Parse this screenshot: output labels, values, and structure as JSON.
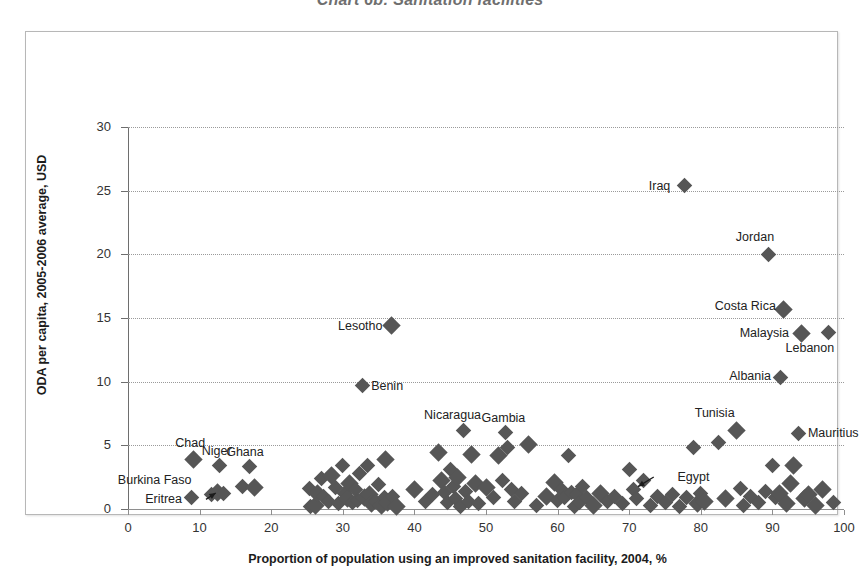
{
  "chart_data": {
    "type": "scatter",
    "title": "Chart 6b: Sanitation facilities",
    "xlabel": "Proportion of population using an improved sanitation facility, 2004,  %",
    "ylabel": "ODA per capita, 2005-2006 average, USD",
    "xlim": [
      0,
      100
    ],
    "ylim": [
      0,
      30
    ],
    "xticks": [
      0,
      10,
      20,
      30,
      40,
      50,
      60,
      70,
      80,
      90,
      100
    ],
    "yticks": [
      0,
      5,
      10,
      15,
      20,
      25,
      30
    ],
    "grid": "horizontal-dotted",
    "legend": "none",
    "marker": "diamond",
    "marker_color": "#565656",
    "labeled_points": [
      {
        "name": "Iraq",
        "x": 77.7,
        "y": 25.4,
        "label_side": "left"
      },
      {
        "name": "Jordan",
        "x": 89.4,
        "y": 20.0,
        "label_side": "above-left"
      },
      {
        "name": "Costa Rica",
        "x": 91.6,
        "y": 15.7,
        "label_side": "left"
      },
      {
        "name": "Malaysia",
        "x": 94.0,
        "y": 13.8,
        "label_side": "left"
      },
      {
        "name": "Lebanon",
        "x": 97.8,
        "y": 13.9,
        "label_side": "below-left"
      },
      {
        "name": "Albania",
        "x": 91.2,
        "y": 10.3,
        "label_side": "left"
      },
      {
        "name": "Tunisia",
        "x": 85.0,
        "y": 6.2,
        "label_side": "above-left"
      },
      {
        "name": "Mauritius",
        "x": 93.7,
        "y": 5.9,
        "label_side": "right"
      },
      {
        "name": "Lesotho",
        "x": 36.8,
        "y": 14.4,
        "label_side": "left"
      },
      {
        "name": "Benin",
        "x": 32.7,
        "y": 9.7,
        "label_side": "right"
      },
      {
        "name": "Nicaragua",
        "x": 46.8,
        "y": 6.2,
        "label_side": "above"
      },
      {
        "name": "Gambia",
        "x": 52.7,
        "y": 6.0,
        "label_side": "above"
      },
      {
        "name": "Chad",
        "x": 9.1,
        "y": 3.9,
        "label_side": "above"
      },
      {
        "name": "Niger",
        "x": 12.8,
        "y": 3.4,
        "label_side": "above-right"
      },
      {
        "name": "Ghana",
        "x": 17.0,
        "y": 3.3,
        "label_side": "above-right"
      },
      {
        "name": "Burkina Faso",
        "x": 12.5,
        "y": 1.3,
        "label_side": "left-arrow"
      },
      {
        "name": "Eritrea",
        "x": 8.8,
        "y": 0.9,
        "label_side": "left"
      },
      {
        "name": "Egypt",
        "x": 70.6,
        "y": 1.5,
        "label_side": "right-arrow"
      }
    ],
    "points": [
      [
        8.8,
        0.9
      ],
      [
        9.1,
        3.9
      ],
      [
        11.7,
        1.1
      ],
      [
        12.5,
        1.3
      ],
      [
        12.8,
        3.4
      ],
      [
        13.3,
        1.2
      ],
      [
        16.0,
        1.8
      ],
      [
        17.0,
        3.3
      ],
      [
        17.6,
        1.7
      ],
      [
        25.3,
        1.6
      ],
      [
        25.5,
        0.2
      ],
      [
        26.2,
        0.3
      ],
      [
        26.5,
        1.2
      ],
      [
        27.0,
        2.4
      ],
      [
        27.3,
        1.0
      ],
      [
        28.0,
        0.6
      ],
      [
        28.4,
        2.6
      ],
      [
        29.0,
        1.7
      ],
      [
        29.4,
        0.4
      ],
      [
        30.0,
        3.4
      ],
      [
        30.3,
        1.2
      ],
      [
        30.7,
        0.8
      ],
      [
        31.0,
        2.0
      ],
      [
        31.4,
        0.5
      ],
      [
        31.8,
        1.5
      ],
      [
        32.0,
        0.7
      ],
      [
        32.3,
        2.8
      ],
      [
        32.7,
        9.7
      ],
      [
        33.0,
        0.9
      ],
      [
        33.4,
        3.4
      ],
      [
        33.7,
        1.1
      ],
      [
        34.0,
        0.4
      ],
      [
        34.5,
        0.6
      ],
      [
        35.0,
        1.9
      ],
      [
        35.4,
        0.3
      ],
      [
        35.8,
        0.9
      ],
      [
        36.0,
        3.9
      ],
      [
        36.3,
        0.5
      ],
      [
        36.8,
        14.4
      ],
      [
        37.0,
        1.0
      ],
      [
        37.5,
        0.2
      ],
      [
        40.0,
        1.5
      ],
      [
        41.5,
        0.6
      ],
      [
        42.5,
        1.1
      ],
      [
        43.3,
        4.4
      ],
      [
        43.8,
        2.2
      ],
      [
        44.2,
        1.3
      ],
      [
        44.6,
        0.5
      ],
      [
        45.0,
        3.1
      ],
      [
        45.4,
        1.8
      ],
      [
        45.8,
        0.8
      ],
      [
        46.0,
        2.5
      ],
      [
        46.4,
        0.2
      ],
      [
        46.8,
        6.2
      ],
      [
        47.2,
        1.4
      ],
      [
        47.6,
        0.6
      ],
      [
        48.0,
        4.3
      ],
      [
        48.5,
        2.0
      ],
      [
        49.0,
        0.4
      ],
      [
        50.0,
        1.7
      ],
      [
        51.0,
        0.9
      ],
      [
        51.8,
        4.2
      ],
      [
        52.3,
        2.2
      ],
      [
        52.7,
        6.0
      ],
      [
        53.0,
        4.8
      ],
      [
        53.5,
        1.5
      ],
      [
        54.0,
        0.6
      ],
      [
        55.0,
        1.2
      ],
      [
        56.0,
        5.1
      ],
      [
        57.0,
        0.3
      ],
      [
        58.5,
        1.0
      ],
      [
        59.5,
        2.1
      ],
      [
        60.0,
        0.7
      ],
      [
        60.5,
        1.5
      ],
      [
        61.0,
        0.9
      ],
      [
        61.5,
        4.2
      ],
      [
        62.0,
        1.3
      ],
      [
        62.3,
        0.2
      ],
      [
        62.7,
        1.1
      ],
      [
        63.0,
        0.5
      ],
      [
        63.5,
        1.8
      ],
      [
        64.0,
        0.9
      ],
      [
        65.0,
        0.3
      ],
      [
        66.0,
        1.2
      ],
      [
        67.0,
        0.6
      ],
      [
        68.0,
        1.0
      ],
      [
        69.0,
        0.4
      ],
      [
        70.0,
        3.1
      ],
      [
        70.6,
        1.5
      ],
      [
        71.0,
        0.8
      ],
      [
        72.0,
        2.2
      ],
      [
        73.0,
        0.3
      ],
      [
        74.0,
        1.0
      ],
      [
        75.0,
        0.5
      ],
      [
        76.0,
        1.1
      ],
      [
        77.0,
        0.2
      ],
      [
        77.7,
        25.4
      ],
      [
        78.0,
        0.9
      ],
      [
        79.0,
        4.8
      ],
      [
        79.5,
        0.4
      ],
      [
        80.0,
        1.2
      ],
      [
        80.5,
        0.6
      ],
      [
        82.5,
        5.2
      ],
      [
        83.5,
        0.8
      ],
      [
        85.0,
        6.2
      ],
      [
        85.5,
        1.6
      ],
      [
        86.0,
        0.3
      ],
      [
        87.0,
        1.0
      ],
      [
        88.0,
        0.5
      ],
      [
        89.0,
        1.4
      ],
      [
        89.4,
        20.0
      ],
      [
        90.0,
        3.4
      ],
      [
        90.5,
        0.9
      ],
      [
        91.0,
        1.2
      ],
      [
        91.2,
        10.3
      ],
      [
        91.6,
        15.7
      ],
      [
        92.0,
        0.4
      ],
      [
        92.5,
        2.0
      ],
      [
        93.0,
        3.4
      ],
      [
        93.7,
        5.9
      ],
      [
        94.0,
        13.8
      ],
      [
        94.5,
        0.8
      ],
      [
        95.0,
        1.1
      ],
      [
        96.0,
        0.3
      ],
      [
        97.0,
        1.5
      ],
      [
        97.8,
        13.9
      ],
      [
        98.5,
        0.5
      ]
    ]
  }
}
